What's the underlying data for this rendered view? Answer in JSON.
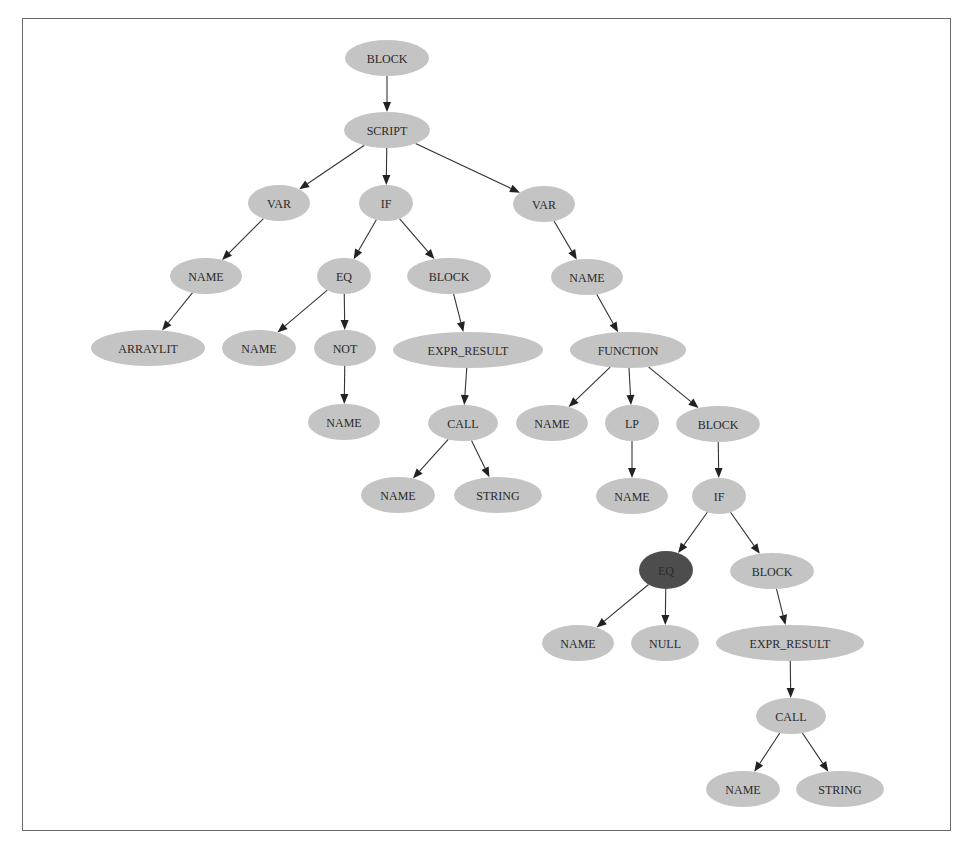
{
  "diagram": {
    "title": "",
    "colors": {
      "node_fill": "#c4c4c4",
      "highlight_fill": "#4d4d4d",
      "edge": "#333333",
      "frame_border": "#6a6a6a"
    },
    "nodes": [
      {
        "id": "n0",
        "label": "BLOCK",
        "cx": 387,
        "cy": 58,
        "rx": 42,
        "ry": 18
      },
      {
        "id": "n1",
        "label": "SCRIPT",
        "cx": 387,
        "cy": 130,
        "rx": 43,
        "ry": 18
      },
      {
        "id": "n2",
        "label": "VAR",
        "cx": 279,
        "cy": 203,
        "rx": 31,
        "ry": 18
      },
      {
        "id": "n3",
        "label": "IF",
        "cx": 386,
        "cy": 203,
        "rx": 27,
        "ry": 18
      },
      {
        "id": "n4",
        "label": "VAR",
        "cx": 544,
        "cy": 204,
        "rx": 31,
        "ry": 18
      },
      {
        "id": "n5",
        "label": "NAME",
        "cx": 206,
        "cy": 276,
        "rx": 36,
        "ry": 18
      },
      {
        "id": "n6",
        "label": "EQ",
        "cx": 344,
        "cy": 276,
        "rx": 27,
        "ry": 18
      },
      {
        "id": "n7",
        "label": "BLOCK",
        "cx": 449,
        "cy": 276,
        "rx": 42,
        "ry": 18
      },
      {
        "id": "n8",
        "label": "NAME",
        "cx": 587,
        "cy": 277,
        "rx": 36,
        "ry": 18
      },
      {
        "id": "n9",
        "label": "ARRAYLIT",
        "cx": 148,
        "cy": 348,
        "rx": 57,
        "ry": 18
      },
      {
        "id": "n10",
        "label": "NAME",
        "cx": 259,
        "cy": 348,
        "rx": 37,
        "ry": 18
      },
      {
        "id": "n11",
        "label": "NOT",
        "cx": 345,
        "cy": 348,
        "rx": 31,
        "ry": 18
      },
      {
        "id": "n12",
        "label": "EXPR_RESULT",
        "cx": 468,
        "cy": 350,
        "rx": 75,
        "ry": 18
      },
      {
        "id": "n13",
        "label": "FUNCTION",
        "cx": 628,
        "cy": 350,
        "rx": 58,
        "ry": 18
      },
      {
        "id": "n14",
        "label": "NAME",
        "cx": 344,
        "cy": 422,
        "rx": 36,
        "ry": 18
      },
      {
        "id": "n15",
        "label": "CALL",
        "cx": 463,
        "cy": 423,
        "rx": 35,
        "ry": 18
      },
      {
        "id": "n16",
        "label": "NAME",
        "cx": 552,
        "cy": 423,
        "rx": 36,
        "ry": 18
      },
      {
        "id": "n17",
        "label": "LP",
        "cx": 632,
        "cy": 423,
        "rx": 27,
        "ry": 18
      },
      {
        "id": "n18",
        "label": "BLOCK",
        "cx": 718,
        "cy": 424,
        "rx": 42,
        "ry": 18
      },
      {
        "id": "n19",
        "label": "NAME",
        "cx": 398,
        "cy": 495,
        "rx": 37,
        "ry": 18
      },
      {
        "id": "n20",
        "label": "STRING",
        "cx": 498,
        "cy": 495,
        "rx": 44,
        "ry": 18
      },
      {
        "id": "n21",
        "label": "NAME",
        "cx": 632,
        "cy": 496,
        "rx": 36,
        "ry": 18
      },
      {
        "id": "n22",
        "label": "IF",
        "cx": 719,
        "cy": 496,
        "rx": 27,
        "ry": 18
      },
      {
        "id": "n23",
        "label": "EQ",
        "cx": 666,
        "cy": 570,
        "rx": 27,
        "ry": 19,
        "highlight": true
      },
      {
        "id": "n24",
        "label": "BLOCK",
        "cx": 772,
        "cy": 571,
        "rx": 42,
        "ry": 18
      },
      {
        "id": "n25",
        "label": "NAME",
        "cx": 578,
        "cy": 643,
        "rx": 36,
        "ry": 18
      },
      {
        "id": "n26",
        "label": "NULL",
        "cx": 665,
        "cy": 643,
        "rx": 34,
        "ry": 18
      },
      {
        "id": "n27",
        "label": "EXPR_RESULT",
        "cx": 790,
        "cy": 643,
        "rx": 74,
        "ry": 18
      },
      {
        "id": "n28",
        "label": "CALL",
        "cx": 791,
        "cy": 716,
        "rx": 35,
        "ry": 18
      },
      {
        "id": "n29",
        "label": "NAME",
        "cx": 743,
        "cy": 789,
        "rx": 37,
        "ry": 18
      },
      {
        "id": "n30",
        "label": "STRING",
        "cx": 840,
        "cy": 789,
        "rx": 44,
        "ry": 18
      }
    ],
    "edges": [
      [
        "n0",
        "n1"
      ],
      [
        "n1",
        "n2"
      ],
      [
        "n1",
        "n3"
      ],
      [
        "n1",
        "n4"
      ],
      [
        "n2",
        "n5"
      ],
      [
        "n5",
        "n9"
      ],
      [
        "n3",
        "n6"
      ],
      [
        "n3",
        "n7"
      ],
      [
        "n6",
        "n10"
      ],
      [
        "n6",
        "n11"
      ],
      [
        "n11",
        "n14"
      ],
      [
        "n7",
        "n12"
      ],
      [
        "n12",
        "n15"
      ],
      [
        "n15",
        "n19"
      ],
      [
        "n15",
        "n20"
      ],
      [
        "n4",
        "n8"
      ],
      [
        "n8",
        "n13"
      ],
      [
        "n13",
        "n16"
      ],
      [
        "n13",
        "n17"
      ],
      [
        "n13",
        "n18"
      ],
      [
        "n17",
        "n21"
      ],
      [
        "n18",
        "n22"
      ],
      [
        "n22",
        "n23"
      ],
      [
        "n22",
        "n24"
      ],
      [
        "n23",
        "n25"
      ],
      [
        "n23",
        "n26"
      ],
      [
        "n24",
        "n27"
      ],
      [
        "n27",
        "n28"
      ],
      [
        "n28",
        "n29"
      ],
      [
        "n28",
        "n30"
      ]
    ]
  }
}
